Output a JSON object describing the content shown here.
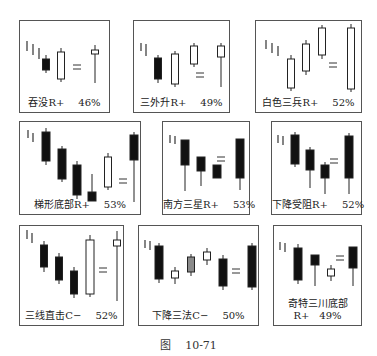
{
  "figure": {
    "label_prefix": "图",
    "label_number": "10-71"
  },
  "colors": {
    "border": "#555555",
    "black": "#111111",
    "white": "#ffffff",
    "gray": "#8a8a8a"
  },
  "panels": [
    {
      "name": "吞没",
      "type": "R+",
      "percent": "46%",
      "box": [
        19,
        20,
        91,
        93
      ],
      "trend_ticks": [
        [
          7,
          20,
          30
        ],
        [
          13,
          23,
          34
        ],
        [
          19,
          27,
          38
        ]
      ],
      "candles": [
        {
          "x": 26,
          "hi": 34,
          "top": 38,
          "bot": 49,
          "lo": 52,
          "fill": "black",
          "w": 7
        },
        {
          "x": 41,
          "hi": 27,
          "top": 31,
          "bot": 58,
          "lo": 61,
          "fill": "white",
          "w": 7
        },
        {
          "x": 75,
          "hi": 24,
          "top": 29,
          "bot": 33,
          "lo": 62,
          "fill": "white",
          "w": 7
        }
      ],
      "equals_x": 57,
      "equals_y": 44
    },
    {
      "name": "三外升",
      "type": "R+",
      "percent": "49%",
      "box": [
        133,
        20,
        97,
        93
      ],
      "trend_ticks": [
        [
          7,
          22,
          30
        ],
        [
          12,
          23,
          35
        ]
      ],
      "candles": [
        {
          "x": 24,
          "hi": 34,
          "top": 37,
          "bot": 58,
          "lo": 62,
          "fill": "black",
          "w": 7
        },
        {
          "x": 41,
          "hi": 30,
          "top": 33,
          "bot": 63,
          "lo": 66,
          "fill": "white",
          "w": 7
        },
        {
          "x": 60,
          "hi": 22,
          "top": 25,
          "bot": 43,
          "lo": 46,
          "fill": "white",
          "w": 7
        },
        {
          "x": 87,
          "hi": 22,
          "top": 25,
          "bot": 36,
          "lo": 66,
          "fill": "white",
          "w": 7
        }
      ],
      "equals_x": 66,
      "equals_y": 52
    },
    {
      "name": "白色三兵",
      "type": "R+",
      "percent": "52%",
      "box": [
        255,
        20,
        107,
        93
      ],
      "trend_ticks": [
        [
          10,
          19,
          28
        ],
        [
          16,
          22,
          32
        ],
        [
          22,
          25,
          35
        ]
      ],
      "candles": [
        {
          "x": 35,
          "hi": 34,
          "top": 38,
          "bot": 67,
          "lo": 70,
          "fill": "white",
          "w": 7
        },
        {
          "x": 50,
          "hi": 19,
          "top": 23,
          "bot": 50,
          "lo": 54,
          "fill": "white",
          "w": 7
        },
        {
          "x": 66,
          "hi": 4,
          "top": 7,
          "bot": 34,
          "lo": 38,
          "fill": "white",
          "w": 7
        },
        {
          "x": 95,
          "hi": 3,
          "top": 7,
          "bot": 68,
          "lo": 71,
          "fill": "white",
          "w": 7
        }
      ],
      "equals_x": 77,
      "equals_y": 42
    },
    {
      "name": "梯形底部",
      "type": "R+",
      "percent": "53%",
      "box": [
        19,
        121,
        122,
        94
      ],
      "trend_ticks": [
        [
          8,
          8,
          16
        ],
        [
          13,
          11,
          20
        ]
      ],
      "candles": [
        {
          "x": 26,
          "hi": 6,
          "top": 10,
          "bot": 39,
          "lo": 43,
          "fill": "black",
          "w": 8
        },
        {
          "x": 42,
          "hi": 24,
          "top": 27,
          "bot": 57,
          "lo": 60,
          "fill": "black",
          "w": 8
        },
        {
          "x": 57,
          "hi": 39,
          "top": 43,
          "bot": 73,
          "lo": 77,
          "fill": "black",
          "w": 8
        },
        {
          "x": 72,
          "hi": 52,
          "top": 70,
          "bot": 79,
          "lo": 79,
          "fill": "black",
          "w": 8
        },
        {
          "x": 88,
          "hi": 31,
          "top": 35,
          "bot": 65,
          "lo": 68,
          "fill": "white",
          "w": 7
        },
        {
          "x": 114,
          "hi": 10,
          "top": 13,
          "bot": 38,
          "lo": 80,
          "fill": "black",
          "w": 8
        }
      ],
      "equals_x": 103,
      "equals_y": 57
    },
    {
      "name": "南方三星",
      "type": "R+",
      "percent": "53%",
      "box": [
        162,
        121,
        88,
        94
      ],
      "trend_ticks": [
        [
          7,
          13,
          21
        ],
        [
          12,
          14,
          22
        ]
      ],
      "candles": [
        {
          "x": 22,
          "hi": 18,
          "top": 18,
          "bot": 43,
          "lo": 69,
          "fill": "black",
          "w": 8
        },
        {
          "x": 38,
          "hi": 35,
          "top": 35,
          "bot": 49,
          "lo": 64,
          "fill": "black",
          "w": 8
        },
        {
          "x": 54,
          "hi": 43,
          "top": 43,
          "bot": 56,
          "lo": 56,
          "fill": "black",
          "w": 8
        },
        {
          "x": 77,
          "hi": 17,
          "top": 17,
          "bot": 56,
          "lo": 68,
          "fill": "black",
          "w": 8
        }
      ],
      "equals_x": 58,
      "equals_y": 35
    },
    {
      "name": "下降受阻",
      "type": "R+",
      "percent": "52%",
      "box": [
        271,
        121,
        91,
        94
      ],
      "trend_ticks": [
        [
          6,
          13,
          21
        ],
        [
          11,
          14,
          23
        ]
      ],
      "candles": [
        {
          "x": 23,
          "hi": 10,
          "top": 13,
          "bot": 42,
          "lo": 45,
          "fill": "black",
          "w": 8
        },
        {
          "x": 38,
          "hi": 25,
          "top": 28,
          "bot": 48,
          "lo": 66,
          "fill": "black",
          "w": 8
        },
        {
          "x": 53,
          "hi": 40,
          "top": 43,
          "bot": 56,
          "lo": 72,
          "fill": "black",
          "w": 8
        },
        {
          "x": 77,
          "hi": 11,
          "top": 14,
          "bot": 56,
          "lo": 72,
          "fill": "black",
          "w": 8
        }
      ],
      "equals_x": 62,
      "equals_y": 37
    },
    {
      "name": "三线直击",
      "type": "C−",
      "percent": "52%",
      "box": [
        19,
        225,
        105,
        101
      ],
      "trend_ticks": [
        [
          7,
          4,
          13
        ],
        [
          12,
          7,
          17
        ]
      ],
      "candles": [
        {
          "x": 24,
          "hi": 15,
          "top": 19,
          "bot": 41,
          "lo": 46,
          "fill": "black",
          "w": 7
        },
        {
          "x": 39,
          "hi": 27,
          "top": 31,
          "bot": 54,
          "lo": 58,
          "fill": "black",
          "w": 7
        },
        {
          "x": 54,
          "hi": 41,
          "top": 45,
          "bot": 68,
          "lo": 72,
          "fill": "black",
          "w": 7
        },
        {
          "x": 70,
          "hi": 9,
          "top": 14,
          "bot": 68,
          "lo": 71,
          "fill": "white",
          "w": 8
        },
        {
          "x": 97,
          "hi": 5,
          "top": 14,
          "bot": 20,
          "lo": 75,
          "fill": "white",
          "w": 7
        }
      ],
      "equals_x": 83,
      "equals_y": 42
    },
    {
      "name": "下降三法",
      "type": "C−",
      "percent": "50%",
      "box": [
        138,
        225,
        121,
        101
      ],
      "trend_ticks": [
        [
          6,
          14,
          22
        ],
        [
          11,
          15,
          24
        ]
      ],
      "candles": [
        {
          "x": 20,
          "hi": 17,
          "top": 20,
          "bot": 53,
          "lo": 57,
          "fill": "black",
          "w": 8
        },
        {
          "x": 36,
          "hi": 41,
          "top": 45,
          "bot": 52,
          "lo": 58,
          "fill": "white",
          "w": 7
        },
        {
          "x": 52,
          "hi": 28,
          "top": 31,
          "bot": 46,
          "lo": 50,
          "fill": "gray",
          "w": 7
        },
        {
          "x": 68,
          "hi": 22,
          "top": 26,
          "bot": 34,
          "lo": 39,
          "fill": "white",
          "w": 7
        },
        {
          "x": 84,
          "hi": 29,
          "top": 33,
          "bot": 60,
          "lo": 64,
          "fill": "black",
          "w": 8
        },
        {
          "x": 113,
          "hi": 17,
          "top": 20,
          "bot": 61,
          "lo": 64,
          "fill": "black",
          "w": 8
        }
      ],
      "equals_x": 97,
      "equals_y": 43
    },
    {
      "name": "奇特三川底部",
      "type": "R+",
      "percent": "49%",
      "box": [
        273,
        225,
        89,
        101
      ],
      "trend_ticks": [
        [
          6,
          16,
          24
        ],
        [
          11,
          17,
          26
        ]
      ],
      "candles": [
        {
          "x": 24,
          "hi": 18,
          "top": 22,
          "bot": 54,
          "lo": 58,
          "fill": "black",
          "w": 8
        },
        {
          "x": 41,
          "hi": 29,
          "top": 29,
          "bot": 39,
          "lo": 60,
          "fill": "black",
          "w": 8
        },
        {
          "x": 57,
          "hi": 39,
          "top": 43,
          "bot": 50,
          "lo": 55,
          "fill": "white",
          "w": 7
        },
        {
          "x": 79,
          "hi": 21,
          "top": 21,
          "bot": 42,
          "lo": 60,
          "fill": "black",
          "w": 8
        }
      ],
      "equals_x": 66,
      "equals_y": 30,
      "caption_two_lines": true
    }
  ]
}
